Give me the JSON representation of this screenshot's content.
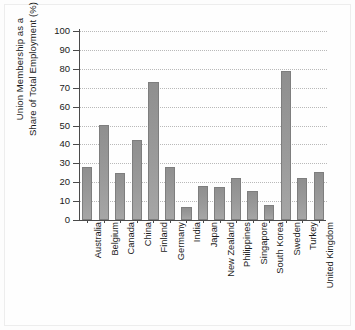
{
  "chart_data": {
    "type": "bar",
    "title": "",
    "xlabel": "",
    "ylabel_lines": [
      "Union Membership as a",
      "Share of Total Employment (%)"
    ],
    "ylabel": "Union Membership as a Share of Total Employment (%)",
    "ylim": [
      0,
      100
    ],
    "yticks": [
      0,
      10,
      20,
      30,
      40,
      50,
      60,
      70,
      80,
      90,
      100
    ],
    "ytick_labels": [
      "0",
      "10",
      "20",
      "30",
      "40",
      "50",
      "60",
      "70",
      "80",
      "90",
      "100"
    ],
    "grid": true,
    "grid_style": "dotted-horizontal",
    "legend": null,
    "categories": [
      "Australia",
      "Belgium",
      "Canada",
      "China",
      "Finland",
      "Germany",
      "India",
      "Japan",
      "New Zealand",
      "Philippines",
      "Singapore",
      "South Korea",
      "Sweden",
      "Turkey",
      "United Kingdom"
    ],
    "values": [
      28,
      50.5,
      24.8,
      42.5,
      73,
      28,
      7,
      18,
      17.3,
      22,
      15.2,
      8,
      79,
      22,
      25.5
    ],
    "bar_color": "#949494",
    "bar_edge_color": "#7e7e7e",
    "axis_color": "#4a4a4a",
    "grid_color": "#b9b9b9",
    "background_color": "#fefefe"
  }
}
